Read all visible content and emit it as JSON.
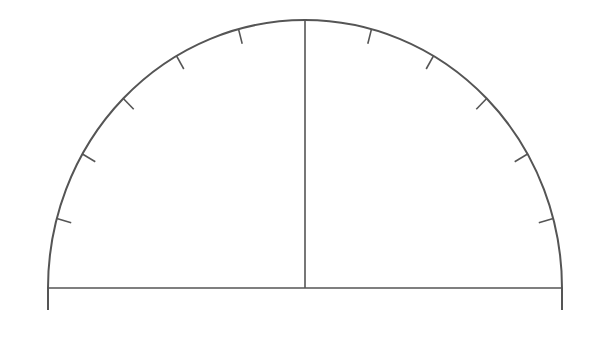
{
  "diagram": {
    "type": "protractor-semicircle",
    "background": "#ffffff",
    "stroke_color": "#555555",
    "center": {
      "x": 305,
      "y": 288
    },
    "radius_x": 257,
    "radius_y": 268,
    "arc_tail_below_baseline": 22,
    "baseline": {
      "x1": 48,
      "x2": 562,
      "y": 288
    },
    "vertical_line": {
      "x": 305,
      "y1": 20,
      "y2": 288
    },
    "tick_angles_deg": [
      15,
      30,
      45,
      60,
      75,
      105,
      120,
      135,
      150,
      165
    ],
    "tick_length": 15,
    "labels": []
  }
}
